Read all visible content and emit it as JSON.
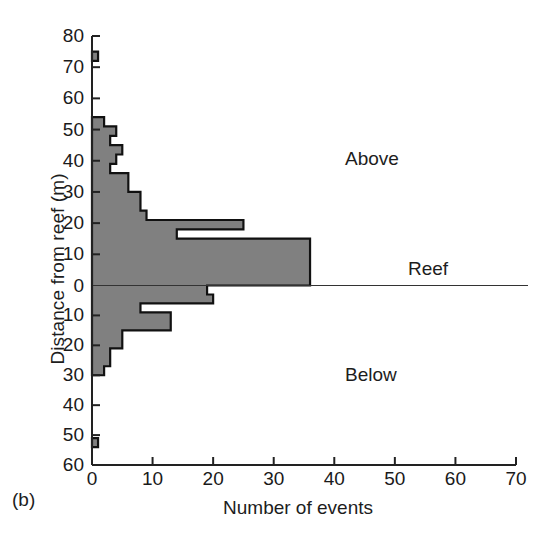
{
  "figure": {
    "panel_tag": "(b)",
    "ylabel": "Distance from reef (m)",
    "xlabel": "Number of events",
    "region_above": "Above",
    "region_below": "Below",
    "reef_label": "Reef",
    "bar_fill": "#808080",
    "bar_stroke": "#111111",
    "axis_color": "#222222"
  },
  "chart_data": {
    "type": "bar",
    "orientation": "horizontal",
    "title": "",
    "xlabel": "Number of events",
    "ylabel": "Distance from reef (m)",
    "xlim": [
      0,
      70
    ],
    "ylim": [
      -60,
      80
    ],
    "xticks": [
      0,
      10,
      20,
      30,
      40,
      50,
      60,
      70
    ],
    "yticks_above": [
      0,
      10,
      20,
      30,
      40,
      50,
      60,
      70,
      80
    ],
    "yticks_below": [
      10,
      20,
      30,
      40,
      50,
      60
    ],
    "grid": false,
    "legend": null,
    "bin_width_m": 3,
    "annotations": [
      {
        "text": "Above",
        "x": 42,
        "y": 45
      },
      {
        "text": "Below",
        "x": 42,
        "y": -26
      },
      {
        "text": "Reef",
        "x": 53,
        "y": 2
      },
      {
        "text": "(b)",
        "x": 0,
        "y": -70
      }
    ],
    "reef_line_y": 0,
    "bars": [
      {
        "bin_low": 72,
        "bin_high": 75,
        "value": 1
      },
      {
        "bin_low": 51,
        "bin_high": 54,
        "value": 2
      },
      {
        "bin_low": 48,
        "bin_high": 51,
        "value": 4
      },
      {
        "bin_low": 45,
        "bin_high": 48,
        "value": 3
      },
      {
        "bin_low": 42,
        "bin_high": 45,
        "value": 5
      },
      {
        "bin_low": 39,
        "bin_high": 42,
        "value": 4
      },
      {
        "bin_low": 36,
        "bin_high": 39,
        "value": 3
      },
      {
        "bin_low": 33,
        "bin_high": 36,
        "value": 6
      },
      {
        "bin_low": 30,
        "bin_high": 33,
        "value": 6
      },
      {
        "bin_low": 27,
        "bin_high": 30,
        "value": 8
      },
      {
        "bin_low": 24,
        "bin_high": 27,
        "value": 8
      },
      {
        "bin_low": 21,
        "bin_high": 24,
        "value": 9
      },
      {
        "bin_low": 18,
        "bin_high": 21,
        "value": 25
      },
      {
        "bin_low": 15,
        "bin_high": 18,
        "value": 14
      },
      {
        "bin_low": 12,
        "bin_high": 15,
        "value": 36
      },
      {
        "bin_low": 9,
        "bin_high": 12,
        "value": 36
      },
      {
        "bin_low": 6,
        "bin_high": 9,
        "value": 36
      },
      {
        "bin_low": 3,
        "bin_high": 6,
        "value": 36
      },
      {
        "bin_low": 0,
        "bin_high": 3,
        "value": 36
      },
      {
        "bin_low": -3,
        "bin_high": 0,
        "value": 19
      },
      {
        "bin_low": -6,
        "bin_high": -3,
        "value": 20
      },
      {
        "bin_low": -9,
        "bin_high": -6,
        "value": 8
      },
      {
        "bin_low": -12,
        "bin_high": -9,
        "value": 13
      },
      {
        "bin_low": -15,
        "bin_high": -12,
        "value": 13
      },
      {
        "bin_low": -18,
        "bin_high": -15,
        "value": 5
      },
      {
        "bin_low": -21,
        "bin_high": -18,
        "value": 5
      },
      {
        "bin_low": -24,
        "bin_high": -21,
        "value": 3
      },
      {
        "bin_low": -27,
        "bin_high": -24,
        "value": 3
      },
      {
        "bin_low": -30,
        "bin_high": -27,
        "value": 2
      },
      {
        "bin_low": -54,
        "bin_high": -51,
        "value": 1
      }
    ]
  }
}
